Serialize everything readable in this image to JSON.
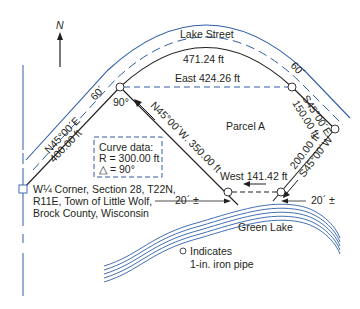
{
  "north_arrow": {
    "label": "N"
  },
  "street": {
    "name": "Lake Street",
    "width_left": "60´",
    "width_right": "60´"
  },
  "curve": {
    "arc_length": "471.24 ft",
    "box_title": "Curve data:",
    "radius": "R = 300.00 ft",
    "delta": "△ = 90°"
  },
  "parcel": {
    "name": "Parcel A",
    "angle": "90°"
  },
  "courses": {
    "east_chord": "East 424.26 ft",
    "nw_bearing": "N45°00´W.  350.00 ft",
    "ne_bearing": "N45°00´E",
    "ne_distance": "400.00 ft",
    "se_bearing": "S45°00´E",
    "se_distance": "150.00 ft",
    "sw_distance": "200.00 ft",
    "sw_bearing": "S45°00´W",
    "west": "West 141.42 ft"
  },
  "offsets": {
    "left": "20´ ±",
    "right": "20´ ±"
  },
  "corner": {
    "line1": "W¼ Corner, Section 28, T22N,",
    "line2": "R11E, Town of Little Wolf,",
    "line3": "Brock County, Wisconsin"
  },
  "lake": {
    "name": "Green Lake"
  },
  "legend": {
    "line1": "Indicates",
    "line2": "1-in. iron pipe"
  },
  "colors": {
    "ink": "#231f20",
    "blue": "#2f5fa8"
  }
}
